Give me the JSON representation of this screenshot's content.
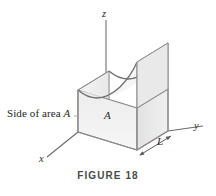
{
  "figure": {
    "caption": "FIGURE 18",
    "annotation_side_prefix": "Side of area ",
    "annotation_side_variable": "A",
    "label_area": "A",
    "label_length": "L",
    "axis_x": "x",
    "axis_y": "y",
    "axis_z": "z",
    "colors": {
      "background": "#ffffff",
      "outline": "#8a8a8a",
      "outline_dark": "#6f6f6f",
      "face_front": "#f2f2f2",
      "face_right": "#e6e6e6",
      "face_left": "#ededed",
      "face_top_curved": "#f7f7f7",
      "axis": "#9a9a9a",
      "text": "#262626",
      "caption_text": "#4a4a4a"
    },
    "geometry": {
      "origin": "78,132",
      "box_front_bottom_right": "137,150",
      "box_back_bottom_right": "168,131",
      "box_height_px": 42,
      "curve_type": "concave-up parabolic surface"
    }
  }
}
